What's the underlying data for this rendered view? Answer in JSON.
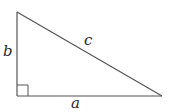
{
  "diagram": {
    "type": "right-triangle",
    "vertices": {
      "top": [
        17,
        12
      ],
      "right_angle": [
        17,
        96
      ],
      "right": [
        162,
        96
      ]
    },
    "sides": [
      {
        "name": "a",
        "label": "a",
        "position": "bottom"
      },
      {
        "name": "b",
        "label": "b",
        "position": "left"
      },
      {
        "name": "c",
        "label": "c",
        "position": "hypotenuse"
      }
    ],
    "right_angle_marker": true,
    "stroke_color": "#555555"
  },
  "labels": {
    "a": "a",
    "b": "b",
    "c": "c"
  }
}
